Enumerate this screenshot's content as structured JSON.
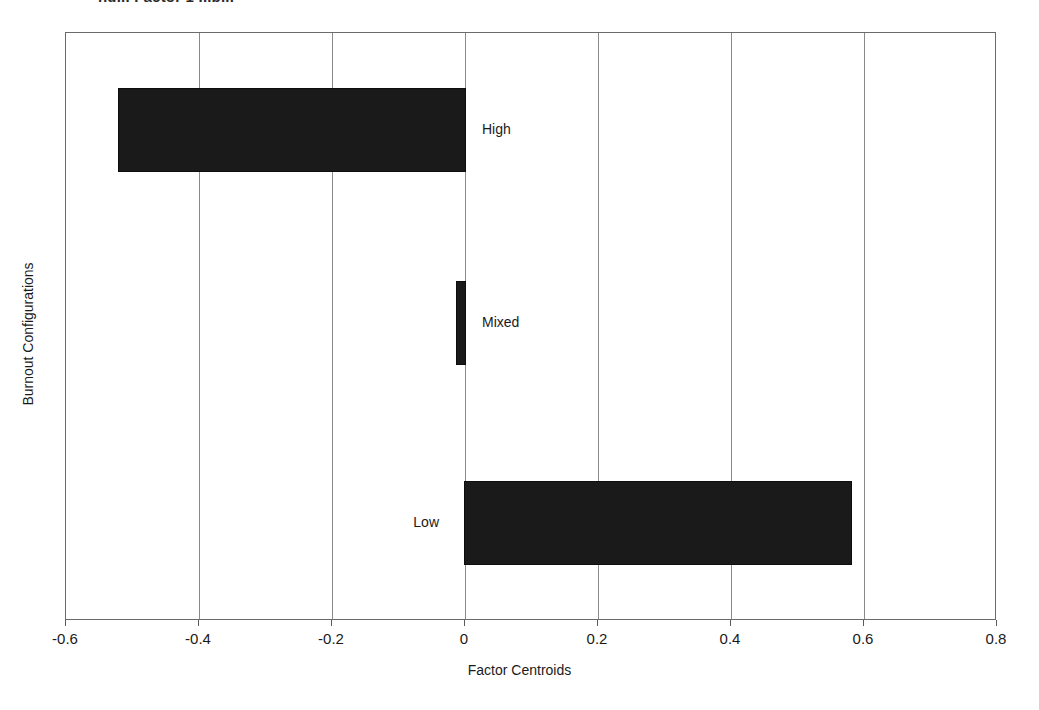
{
  "figure": {
    "top_fragment_text": "ng... Factor 1 ...p...",
    "background_color": "#ffffff",
    "frame_color": "#6b6b6b",
    "bar_color": "#1a1a1a",
    "gridline_color": "#8a8a8a"
  },
  "chart_data": {
    "type": "bar",
    "orientation": "horizontal",
    "title": "",
    "xlabel": "Factor Centroids",
    "ylabel": "Burnout Configurations",
    "categories": [
      "High",
      "Mixed",
      "Low"
    ],
    "values": [
      -0.52,
      -0.01,
      0.58
    ],
    "xlim": [
      -0.6,
      0.8
    ],
    "xticks": [
      -0.6,
      -0.4,
      -0.2,
      0,
      0.2,
      0.4,
      0.6,
      0.8
    ],
    "xticklabels": [
      "-0.6",
      "-0.4",
      "-0.2",
      "0",
      "0.2",
      "0.4",
      "0.6",
      "0.8"
    ],
    "yticklabels": [],
    "grid": "vertical",
    "legend": "none",
    "bar_color": "#1a1a1a",
    "data_labels_inside_plot": [
      {
        "label": "High",
        "value": -0.52,
        "label_side": "right"
      },
      {
        "label": "Mixed",
        "value": -0.01,
        "label_side": "right"
      },
      {
        "label": "Low",
        "value": 0.58,
        "label_side": "left"
      }
    ]
  }
}
